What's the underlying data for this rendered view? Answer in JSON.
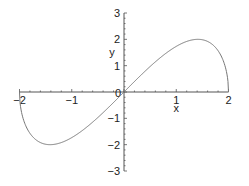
{
  "chart_data": {
    "type": "line",
    "title": "",
    "xlabel": "x",
    "ylabel": "y",
    "xlim": [
      -2,
      2
    ],
    "ylim": [
      -3,
      3
    ],
    "grid": false,
    "legend": null,
    "x_ticks": [
      -2,
      -1,
      0,
      1,
      2
    ],
    "x_tick_labels": [
      "-2",
      "-1",
      "0",
      "1",
      "2"
    ],
    "y_ticks": [
      -3,
      -2,
      -1,
      1,
      2,
      3
    ],
    "y_tick_labels": [
      "-3",
      "-2",
      "-1",
      "1",
      "2",
      "3"
    ],
    "origin_label": "0",
    "series": [
      {
        "name": "y = x*sqrt(4 - x^2)",
        "color": "#777777",
        "x": [
          -2,
          -1.99,
          -1.95,
          -1.9,
          -1.8,
          -1.7,
          -1.6,
          -1.5,
          -1.414,
          -1.3,
          -1.2,
          -1.0,
          -0.8,
          -0.6,
          -0.4,
          -0.2,
          0,
          0.2,
          0.4,
          0.6,
          0.8,
          1.0,
          1.2,
          1.3,
          1.414,
          1.5,
          1.6,
          1.7,
          1.8,
          1.9,
          1.95,
          1.99,
          2
        ],
        "y": [
          0,
          -0.398,
          -0.866,
          -1.187,
          -1.569,
          -1.791,
          -1.92,
          -1.984,
          -2.0,
          -1.976,
          -1.92,
          -1.732,
          -1.466,
          -1.145,
          -0.784,
          -0.398,
          0,
          0.398,
          0.784,
          1.145,
          1.466,
          1.732,
          1.92,
          1.976,
          2.0,
          1.984,
          1.92,
          1.791,
          1.569,
          1.187,
          0.866,
          0.398,
          0
        ]
      }
    ],
    "colors": {
      "axis": "#555555",
      "curve": "#777777",
      "text": "#222222"
    }
  }
}
